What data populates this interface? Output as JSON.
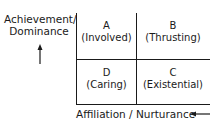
{
  "y_axis": {
    "label_line1": "Achievement/",
    "label_line2": "Dominance",
    "arrow": "up-arrow"
  },
  "x_axis": {
    "label": "Affiliation / Nurturance",
    "arrow": "left-arrow"
  },
  "quadrants": [
    {
      "letter": "A",
      "name": "(Involved)",
      "position": "top-left"
    },
    {
      "letter": "B",
      "name": "(Thrusting)",
      "position": "top-right"
    },
    {
      "letter": "D",
      "name": "(Caring)",
      "position": "bottom-left"
    },
    {
      "letter": "C",
      "name": "(Existential)",
      "position": "bottom-right"
    }
  ]
}
